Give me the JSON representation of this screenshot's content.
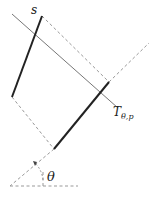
{
  "labels": {
    "s": "s",
    "projection": "T",
    "projection_sub": "θ,p",
    "angle": "θ"
  },
  "colors": {
    "thick": "#222222",
    "thin": "#777777",
    "dashed": "#999999"
  }
}
